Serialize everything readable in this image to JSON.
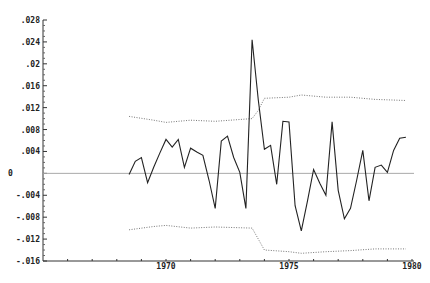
{
  "chart_data": {
    "type": "line",
    "title": "",
    "xlabel": "",
    "ylabel": "",
    "xlim": [
      1965.5,
      1980.0
    ],
    "ylim": [
      -0.016,
      0.028
    ],
    "grid": false,
    "zero_line": true,
    "y_ticks": [
      ".028",
      ".024",
      ".02",
      ".016",
      ".012",
      ".008",
      ".004",
      "0",
      "-.004",
      "-.008",
      "-.012",
      "-.016"
    ],
    "y_tick_values": [
      0.028,
      0.024,
      0.02,
      0.016,
      0.012,
      0.008,
      0.004,
      0,
      -0.004,
      -0.008,
      -0.012,
      -0.016
    ],
    "x_ticks": [
      "1970",
      "1975",
      "1980"
    ],
    "x_tick_values": [
      1970,
      1975,
      1980
    ],
    "series": [
      {
        "name": "series",
        "style": "solid",
        "x_start": 1968.5,
        "x_step": 0.25,
        "values": [
          -0.0002,
          0.0022,
          0.0029,
          -0.0017,
          0.0011,
          0.0037,
          0.0062,
          0.0048,
          0.0062,
          0.0011,
          0.0046,
          0.0039,
          0.0033,
          -0.0013,
          -0.0064,
          0.0059,
          0.0068,
          0.0029,
          0.0002,
          -0.0064,
          0.0244,
          0.0134,
          0.0044,
          0.0051,
          -0.002,
          0.0095,
          0.0094,
          -0.0059,
          -0.0105,
          -0.005,
          0.0007,
          -0.0018,
          -0.004,
          0.0094,
          -0.0031,
          -0.0083,
          -0.0064,
          -0.0013,
          0.0042,
          -0.005,
          0.0011,
          0.0015,
          0.0002,
          0.0042,
          0.0064,
          0.0066
        ]
      },
      {
        "name": "upper band",
        "style": "dotted",
        "x": [
          1968.5,
          1969.5,
          1970.0,
          1971.0,
          1972.0,
          1973.5,
          1973.75,
          1974.0,
          1975.0,
          1975.5,
          1976.5,
          1977.5,
          1978.5,
          1979.75
        ],
        "values": [
          0.0104,
          0.0097,
          0.0093,
          0.0097,
          0.0095,
          0.01,
          0.0115,
          0.0137,
          0.0139,
          0.0143,
          0.0139,
          0.0139,
          0.0135,
          0.0133
        ]
      },
      {
        "name": "lower band",
        "style": "dotted",
        "x": [
          1968.5,
          1969.5,
          1970.0,
          1971.0,
          1972.0,
          1973.5,
          1973.75,
          1974.0,
          1975.0,
          1975.5,
          1976.5,
          1977.5,
          1978.5,
          1979.75
        ],
        "values": [
          -0.0103,
          -0.0097,
          -0.0095,
          -0.01,
          -0.0098,
          -0.01,
          -0.012,
          -0.014,
          -0.0143,
          -0.0146,
          -0.0143,
          -0.0141,
          -0.0138,
          -0.0138
        ]
      }
    ]
  }
}
